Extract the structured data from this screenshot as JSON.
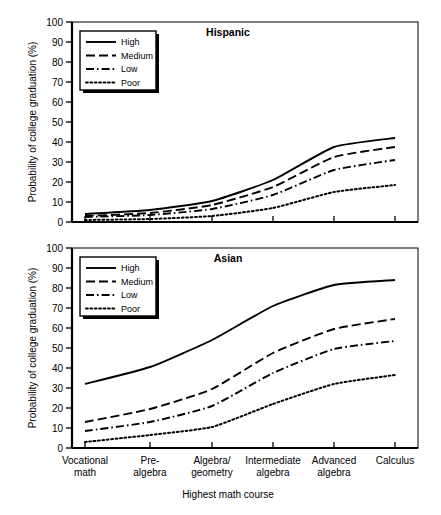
{
  "figure": {
    "width": 441,
    "height": 515,
    "background": "#ffffff",
    "ink_color": "#000000"
  },
  "axis": {
    "y_title": "Probability of college graduation (%)",
    "x_title": "Highest math course",
    "y_ticks": [
      "0",
      "10",
      "20",
      "30",
      "40",
      "50",
      "60",
      "70",
      "80",
      "90",
      "100"
    ],
    "x_categories": [
      {
        "line1": "Vocational",
        "line2": "math"
      },
      {
        "line1": "Pre-",
        "line2": "algebra"
      },
      {
        "line1": "Algebra/",
        "line2": "geometry"
      },
      {
        "line1": "Intermediate",
        "line2": "algebra"
      },
      {
        "line1": "Advanced",
        "line2": "algebra"
      },
      {
        "line1": "Calculus",
        "line2": ""
      }
    ]
  },
  "legend": {
    "entries": [
      {
        "label": "High",
        "dash": "none"
      },
      {
        "label": "Medium",
        "dash": "long"
      },
      {
        "label": "Low",
        "dash": "dashdot"
      },
      {
        "label": "Poor",
        "dash": "dot"
      }
    ]
  },
  "panels": [
    {
      "id": "hispanic",
      "title": "Hispanic"
    },
    {
      "id": "asian",
      "title": "Asian"
    }
  ],
  "chart_data": [
    {
      "type": "line",
      "title": "Hispanic",
      "xlabel": "Highest math course",
      "ylabel": "Probability of college graduation (%)",
      "ylim": [
        0,
        100
      ],
      "yticks": [
        0,
        10,
        20,
        30,
        40,
        50,
        60,
        70,
        80,
        90,
        100
      ],
      "grid": false,
      "legend_position": "upper-left",
      "categories": [
        "Vocational math",
        "Pre-algebra",
        "Algebra/geometry",
        "Intermediate algebra",
        "Advanced algebra",
        "Calculus"
      ],
      "series": [
        {
          "name": "High",
          "dash": "none",
          "values": [
            4.0,
            6.0,
            10.5,
            21.0,
            37.5,
            42.0
          ]
        },
        {
          "name": "Medium",
          "dash": "long",
          "values": [
            3.0,
            4.5,
            8.5,
            17.5,
            32.5,
            37.5
          ]
        },
        {
          "name": "Low",
          "dash": "dashdot",
          "values": [
            2.5,
            3.5,
            6.5,
            13.5,
            26.0,
            31.0
          ]
        },
        {
          "name": "Poor",
          "dash": "dot",
          "values": [
            1.0,
            1.5,
            3.0,
            7.0,
            15.0,
            18.5
          ]
        }
      ]
    },
    {
      "type": "line",
      "title": "Asian",
      "xlabel": "Highest math course",
      "ylabel": "Probability of college graduation (%)",
      "ylim": [
        0,
        100
      ],
      "yticks": [
        0,
        10,
        20,
        30,
        40,
        50,
        60,
        70,
        80,
        90,
        100
      ],
      "grid": false,
      "legend_position": "upper-left",
      "categories": [
        "Vocational math",
        "Pre-algebra",
        "Algebra/geometry",
        "Intermediate algebra",
        "Advanced algebra",
        "Calculus"
      ],
      "series": [
        {
          "name": "High",
          "dash": "none",
          "values": [
            32.0,
            40.5,
            54.0,
            71.0,
            81.5,
            84.0
          ]
        },
        {
          "name": "Medium",
          "dash": "long",
          "values": [
            13.0,
            19.5,
            29.5,
            47.5,
            59.5,
            64.5
          ]
        },
        {
          "name": "Low",
          "dash": "dashdot",
          "values": [
            8.5,
            13.0,
            21.0,
            37.5,
            49.5,
            53.5
          ]
        },
        {
          "name": "Poor",
          "dash": "dot",
          "values": [
            3.0,
            6.5,
            10.5,
            22.0,
            32.0,
            36.5
          ]
        }
      ]
    }
  ]
}
